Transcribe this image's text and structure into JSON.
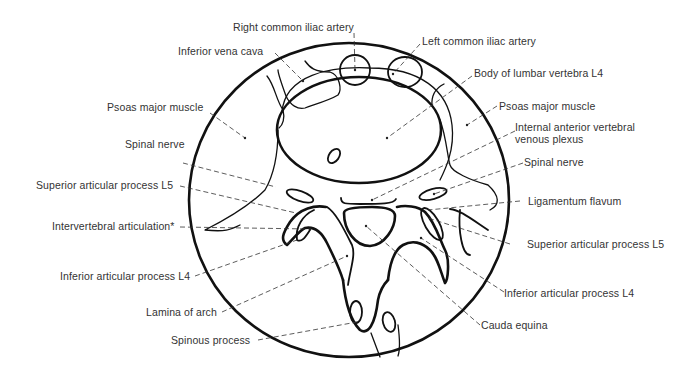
{
  "diagram": {
    "labels": {
      "right_common_iliac_artery": "Right common iliac artery",
      "left_common_iliac_artery": "Left common iliac artery",
      "inferior_vena_cava": "Inferior vena cava",
      "body_of_lumbar_vertebra": "Body of lumbar vertebra L4",
      "psoas_major_left": "Psoas major muscle",
      "psoas_major_right": "Psoas major muscle",
      "internal_venous_plexus_line1": "Internal anterior vertebral",
      "internal_venous_plexus_line2": "venous plexus",
      "spinal_nerve_left": "Spinal nerve",
      "spinal_nerve_right": "Spinal nerve",
      "superior_articular_left": "Superior articular process L5",
      "superior_articular_right": "Superior articular process L5",
      "ligamentum_flavum": "Ligamentum flavum",
      "intervertebral_articulation": "Intervertebral articulation*",
      "inferior_articular_left": "Inferior articular process L4",
      "inferior_articular_right": "Inferior articular process L4",
      "lamina_of_arch": "Lamina of arch",
      "cauda_equina": "Cauda equina",
      "spinous_process": "Spinous process"
    }
  }
}
